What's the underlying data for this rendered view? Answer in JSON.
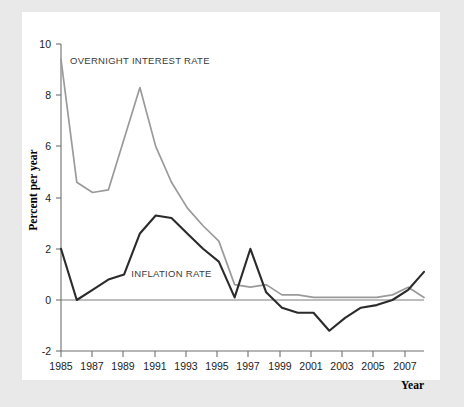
{
  "chart_data": {
    "type": "line",
    "title": "",
    "xlabel": "Year",
    "ylabel": "Percent per year",
    "xlim": [
      1985,
      2008
    ],
    "ylim": [
      -2,
      10
    ],
    "grid": false,
    "legend_position": "inline-annotations",
    "xticks": [
      "1985",
      "1987",
      "1989",
      "1991",
      "1993",
      "1995",
      "1997",
      "1999",
      "2001",
      "2003",
      "2005",
      "2007"
    ],
    "yticks": [
      "10",
      "8",
      "6",
      "4",
      "2",
      "0",
      "-2"
    ],
    "x": [
      1985,
      1986,
      1987,
      1988,
      1989,
      1990,
      1991,
      1992,
      1993,
      1994,
      1995,
      1996,
      1997,
      1998,
      1999,
      2000,
      2001,
      2002,
      2003,
      2004,
      2005,
      2006,
      2007,
      2008
    ],
    "series": [
      {
        "name": "OVERNIGHT INTEREST RATE",
        "color": "#9a9a9a",
        "values": [
          9.4,
          4.6,
          4.2,
          4.3,
          6.3,
          8.3,
          6.0,
          4.6,
          3.6,
          2.9,
          2.3,
          0.6,
          0.5,
          0.6,
          0.2,
          0.2,
          0.1,
          0.1,
          0.1,
          0.1,
          0.1,
          0.2,
          0.5,
          0.1
        ]
      },
      {
        "name": "INFLATION RATE",
        "color": "#2b2b2b",
        "values": [
          2.0,
          0.0,
          0.4,
          0.8,
          1.0,
          2.6,
          3.3,
          3.2,
          2.6,
          2.0,
          1.5,
          0.1,
          2.0,
          0.3,
          -0.3,
          -0.5,
          -0.5,
          -1.2,
          -0.7,
          -0.3,
          -0.2,
          0.0,
          0.4,
          1.1
        ]
      }
    ],
    "annotations": [
      {
        "text": "OVERNIGHT INTEREST RATE",
        "x": 1990,
        "y": 9.2
      },
      {
        "text": "INFLATION RATE",
        "x": 1992,
        "y": 0.9
      }
    ]
  },
  "figure": {
    "background_color": "#e9e9e9",
    "panel_color": "#ffffff",
    "axis_color": "#6f6f6f"
  }
}
